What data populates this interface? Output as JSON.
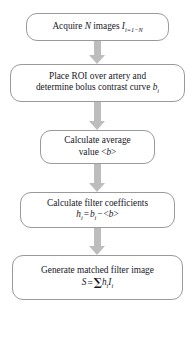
{
  "diagram": {
    "type": "flowchart",
    "orientation": "vertical",
    "background_color": "#ffffff",
    "node_border_color": "#9a9a9a",
    "node_fill_color": "#ffffff",
    "arrow_color": "#bdbdbd",
    "text_color": "#17171f",
    "nodes": [
      {
        "id": "acquire-images",
        "shape": "rounded-rectangle",
        "lines": [
          "Acquire N images I i=1−N"
        ],
        "text_plain": "Acquire N images I_{i=1-N}",
        "line1_pre": "Acquire ",
        "line1_var1": "N",
        "line1_mid": " images ",
        "line1_var2": "I",
        "line1_sub": "i=1−N"
      },
      {
        "id": "place-roi",
        "shape": "rounded-rectangle",
        "lines": [
          "Place ROI over artery and",
          "determine bolus contrast curve b i"
        ],
        "text_plain": "Place ROI over artery and determine bolus contrast curve b_i",
        "line1": "Place ROI over artery and",
        "line2_pre": "determine bolus contrast curve ",
        "line2_var": "b",
        "line2_sub": "i"
      },
      {
        "id": "calculate-average",
        "shape": "rounded-rectangle",
        "lines": [
          "Calculate average",
          "value <b>"
        ],
        "text_plain": "Calculate average value <b>",
        "line1": "Calculate average",
        "line2_pre": "value <",
        "line2_var": "b",
        "line2_post": ">"
      },
      {
        "id": "calculate-filter-coefficients",
        "shape": "rounded-rectangle",
        "lines": [
          "Calculate filter coefficients",
          "h i = b i − <b>"
        ],
        "text_plain": "Calculate filter coefficients h_i = b_i - <b>",
        "line1": "Calculate filter coefficients",
        "eq_lhs_var": "h",
        "eq_lhs_sub": "i",
        "eq_equals": "=",
        "eq_rhs_var": "b",
        "eq_rhs_sub": "i",
        "eq_minus": "−",
        "eq_tail_pre": "<",
        "eq_tail_var": "b",
        "eq_tail_post": ">"
      },
      {
        "id": "generate-matched-filter-image",
        "shape": "rounded-rectangle",
        "lines": [
          "Generate matched filter image",
          "S = Σ h i I i"
        ],
        "text_plain": "Generate matched filter image S = Σ h_i I_i",
        "line1": "Generate matched filter image",
        "eq_lhs_var": "S",
        "eq_equals": "=",
        "eq_sigma": "∑",
        "eq_term1_var": "h",
        "eq_term1_sub": "i",
        "eq_term2_var": "I",
        "eq_term2_sub": "i"
      }
    ],
    "arrows": [
      {
        "id": "arrow-1",
        "from": "acquire-images",
        "to": "place-roi",
        "direction": "down"
      },
      {
        "id": "arrow-2",
        "from": "place-roi",
        "to": "calculate-average",
        "direction": "down"
      },
      {
        "id": "arrow-3",
        "from": "calculate-average",
        "to": "calculate-filter-coefficients",
        "direction": "down"
      },
      {
        "id": "arrow-4",
        "from": "calculate-filter-coefficients",
        "to": "generate-matched-filter-image",
        "direction": "down"
      }
    ]
  }
}
